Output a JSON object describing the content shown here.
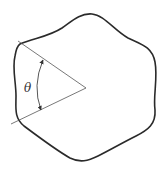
{
  "diagram": {
    "title": "",
    "shape": "wavy-hexagonal-profile",
    "angle_label": "θ",
    "colors": {
      "outline": "#2a2a2a",
      "radial_lines": "#555555",
      "arc": "#444444",
      "background": "#ffffff"
    },
    "center": {
      "x": 86,
      "y": 88
    },
    "radial_lines": [
      {
        "name": "upper",
        "to": {
          "x": 18,
          "y": 41
        }
      },
      {
        "name": "lower",
        "to": {
          "x": 11,
          "y": 124
        }
      }
    ],
    "label_position": {
      "x": 23,
      "y": 81
    }
  }
}
